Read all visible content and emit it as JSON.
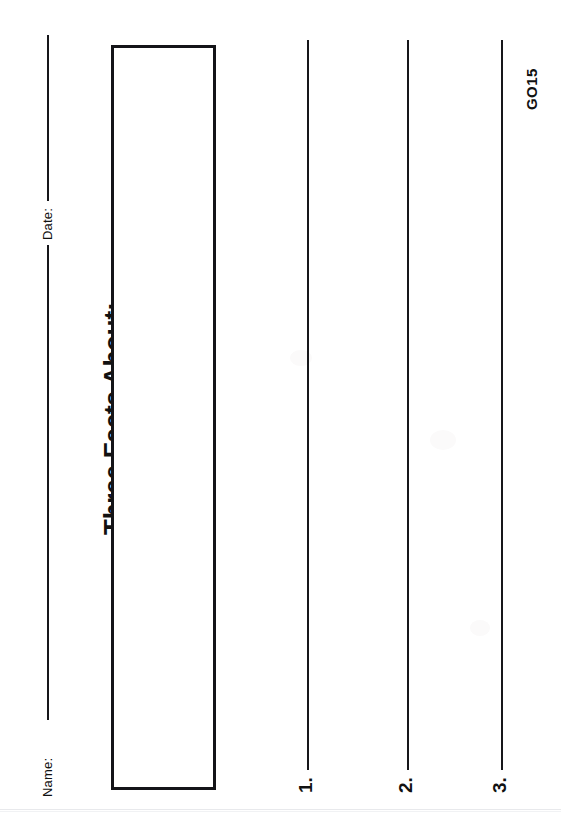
{
  "document": {
    "kind": "worksheet-scan",
    "orientation": "rotated-90-ccw",
    "page_background": "#ffffff",
    "ink_color": "#16161a"
  },
  "fields": {
    "name_label": "Name:",
    "date_label": "Date:"
  },
  "heading": {
    "title": "Three Facts About:"
  },
  "drawing_area": {
    "caption": ""
  },
  "fact_lines": [
    {
      "number": "1."
    },
    {
      "number": "2."
    },
    {
      "number": "3."
    }
  ],
  "footer": {
    "code": "GO15"
  }
}
